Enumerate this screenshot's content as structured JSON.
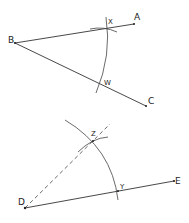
{
  "diagram": {
    "top_figure": {
      "vertex": {
        "label": "B",
        "x": 15,
        "y": 43
      },
      "ray_1_end": {
        "label": "A",
        "x": 134,
        "y": 24
      },
      "ray_2_end": {
        "label": "C",
        "x": 146,
        "y": 106
      },
      "arc_intersection_1": {
        "label": "X",
        "x": 107,
        "y": 29
      },
      "arc_intersection_2": {
        "label": "W",
        "x": 101,
        "y": 84
      }
    },
    "bottom_figure": {
      "vertex": {
        "label": "D",
        "x": 25,
        "y": 208
      },
      "ray_end": {
        "label": "E",
        "x": 174,
        "y": 181
      },
      "arc_intersection": {
        "label": "Y",
        "x": 118,
        "y": 191
      },
      "copied_point": {
        "label": "Z",
        "x": 93,
        "y": 141
      }
    },
    "colors": {
      "stroke": "#333333",
      "background": "#ffffff"
    }
  }
}
